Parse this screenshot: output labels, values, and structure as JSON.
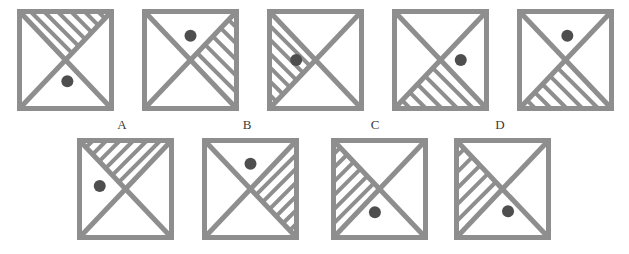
{
  "puzzle": {
    "type": "visual-analogy-matrix",
    "colors": {
      "stroke": "#8e8e8e",
      "dot": "#4e4e4e",
      "background": "#ffffff",
      "label_text": "#3a3a38"
    },
    "geometry": {
      "stroke_width": 5,
      "hatch_stroke_width": 4,
      "dot_radius": 6,
      "top_row_square": {
        "width": 92,
        "height": 97
      },
      "bottom_row_square": {
        "width": 92,
        "height": 97
      }
    },
    "sequence_label": "",
    "sequence": [
      {
        "id": "seq-1",
        "position": 1,
        "hatched_triangle": "top",
        "hatch_direction": "nw-se",
        "hatch_line_count": 6,
        "dot_triangle": "bottom",
        "dot": {
          "x": 0.52,
          "y": 0.72
        }
      },
      {
        "id": "seq-2",
        "position": 2,
        "hatched_triangle": "right",
        "hatch_direction": "nw-se",
        "hatch_line_count": 5,
        "dot_triangle": "top",
        "dot": {
          "x": 0.5,
          "y": 0.25
        }
      },
      {
        "id": "seq-3",
        "position": 3,
        "hatched_triangle": "left",
        "hatch_direction": "nw-se",
        "hatch_line_count": 6,
        "dot_triangle": "left",
        "dot": {
          "x": 0.29,
          "y": 0.5
        }
      },
      {
        "id": "seq-4",
        "position": 4,
        "hatched_triangle": "bottom",
        "hatch_direction": "nw-se",
        "hatch_line_count": 5,
        "dot_triangle": "right",
        "dot": {
          "x": 0.72,
          "y": 0.5
        }
      },
      {
        "id": "seq-5",
        "position": 5,
        "hatched_triangle": "bottom",
        "hatch_direction": "nw-se",
        "hatch_line_count": 5,
        "dot_triangle": "top",
        "dot": {
          "x": 0.52,
          "y": 0.25
        }
      }
    ],
    "options": [
      {
        "id": "opt-a",
        "label": "A",
        "hatched_triangle": "top",
        "hatch_direction": "ne-sw",
        "hatch_line_count": 6,
        "dot_triangle": "left",
        "dot": {
          "x": 0.22,
          "y": 0.47
        }
      },
      {
        "id": "opt-b",
        "label": "B",
        "hatched_triangle": "right",
        "hatch_direction": "ne-sw",
        "hatch_line_count": 6,
        "dot_triangle": "top",
        "dot": {
          "x": 0.5,
          "y": 0.24
        }
      },
      {
        "id": "opt-c",
        "label": "C",
        "hatched_triangle": "left",
        "hatch_direction": "ne-sw",
        "hatch_line_count": 6,
        "dot_triangle": "bottom",
        "dot": {
          "x": 0.45,
          "y": 0.74
        }
      },
      {
        "id": "opt-d",
        "label": "D",
        "hatched_triangle": "left",
        "hatch_direction": "ne-sw",
        "hatch_line_count": 5,
        "dot_triangle": "bottom",
        "dot": {
          "x": 0.56,
          "y": 0.73
        }
      }
    ],
    "layout": {
      "top_row": [
        {
          "x": 19,
          "y": 11
        },
        {
          "x": 144,
          "y": 11
        },
        {
          "x": 269,
          "y": 11
        },
        {
          "x": 394,
          "y": 11
        },
        {
          "x": 519,
          "y": 11
        }
      ],
      "label_row": [
        {
          "x": 110,
          "y": 118
        },
        {
          "x": 235,
          "y": 118
        },
        {
          "x": 363,
          "y": 118
        },
        {
          "x": 488,
          "y": 118
        }
      ],
      "bottom_row": [
        {
          "x": 79,
          "y": 140
        },
        {
          "x": 204,
          "y": 140
        },
        {
          "x": 333,
          "y": 140
        },
        {
          "x": 456,
          "y": 140
        }
      ]
    }
  }
}
